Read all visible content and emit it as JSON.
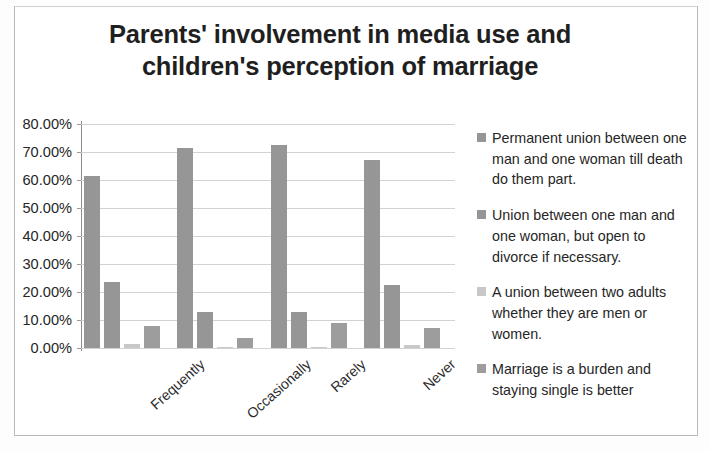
{
  "chart_data": {
    "type": "bar",
    "title": "Parents' involvement in media use and children's perception of marriage",
    "title_lines": [
      "Parents' involvement in media use and",
      "children's perception of marriage"
    ],
    "xlabel": "",
    "ylabel": "",
    "ylim": [
      0,
      80
    ],
    "ytick_values": [
      0,
      10,
      20,
      30,
      40,
      50,
      60,
      70,
      80
    ],
    "ytick_labels": [
      "0.00%",
      "10.00%",
      "20.00%",
      "30.00%",
      "40.00%",
      "50.00%",
      "60.00%",
      "70.00%",
      "80.00%"
    ],
    "grid": true,
    "legend_position": "right",
    "categories": [
      "Frequently",
      "Occasionally",
      "Rarely",
      "Never"
    ],
    "series": [
      {
        "name": "Permanent union between one man and one woman till death do them part.",
        "color": "#969696",
        "values": [
          61.5,
          71.5,
          72.5,
          67.0
        ]
      },
      {
        "name": "Union between one man and one woman, but open to divorce if necessary.",
        "color": "#969696",
        "values": [
          23.5,
          13.0,
          13.0,
          22.5
        ]
      },
      {
        "name": "A union between two adults whether they are men or women.",
        "color": "#c8c8c8",
        "values": [
          1.5,
          0.5,
          0.5,
          1.0
        ]
      },
      {
        "name": "Marriage is a burden and staying single is better",
        "color": "#9d9d9d",
        "values": [
          8.0,
          3.5,
          9.0,
          7.0
        ]
      }
    ]
  },
  "colors": {
    "bar_primary": "#969696",
    "bar_light": "#c8c8c8",
    "gridline": "#d2d2d2",
    "axis": "#8d8d8d",
    "text": "#262626",
    "frame_border": "#b9b9b9",
    "background": "#ffffff"
  }
}
